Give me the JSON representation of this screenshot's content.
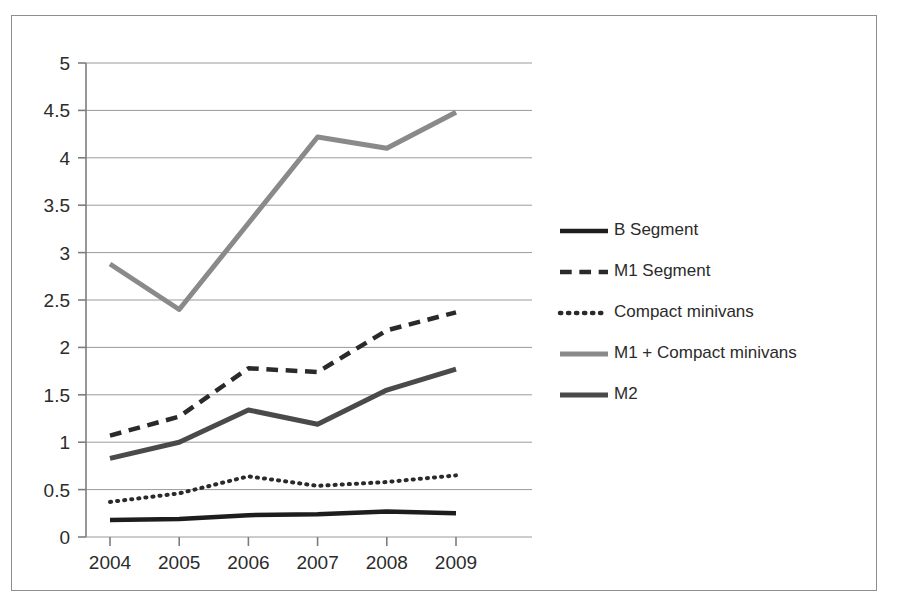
{
  "chart_data": {
    "type": "line",
    "title": "",
    "subtitle": "",
    "xlabel": "",
    "ylabel": "",
    "x": [
      "2004",
      "2005",
      "2006",
      "2007",
      "2008",
      "2009"
    ],
    "categories": [
      "2004",
      "2005",
      "2006",
      "2007",
      "2008",
      "2009"
    ],
    "xlim": [
      "2004",
      "2009"
    ],
    "ylim": [
      0,
      5
    ],
    "ytick_labels": [
      "0",
      "0.5",
      "1",
      "1.5",
      "2",
      "2.5",
      "3",
      "3.5",
      "4",
      "4.5",
      "5"
    ],
    "ytick_values": [
      0,
      0.5,
      1,
      1.5,
      2,
      2.5,
      3,
      3.5,
      4,
      4.5,
      5
    ],
    "grid": "horizontal",
    "legend_position": "right",
    "series": [
      {
        "name": "B Segment",
        "style": "solid",
        "color": "#1d1d1d",
        "width": 4.5,
        "values": [
          0.18,
          0.19,
          0.23,
          0.24,
          0.27,
          0.25
        ]
      },
      {
        "name": "M1 Segment",
        "style": "dashed",
        "color": "#2a2a2a",
        "width": 4.5,
        "values": [
          1.07,
          1.27,
          1.78,
          1.74,
          2.18,
          2.37
        ]
      },
      {
        "name": "Compact minivans",
        "style": "dotted",
        "color": "#2a2a2a",
        "width": 4.0,
        "values": [
          0.37,
          0.46,
          0.64,
          0.54,
          0.58,
          0.65
        ]
      },
      {
        "name": "M1 + Compact minivans",
        "style": "solid",
        "color": "#8a8a8a",
        "width": 5.0,
        "values": [
          2.88,
          2.4,
          3.31,
          4.22,
          4.1,
          4.48
        ]
      },
      {
        "name": "M2",
        "style": "solid",
        "color": "#4a4a4a",
        "width": 5.0,
        "values": [
          0.83,
          1.0,
          1.34,
          1.19,
          1.55,
          1.77
        ]
      }
    ]
  },
  "legend": {
    "items": [
      {
        "label": "B Segment"
      },
      {
        "label": "M1  Segment"
      },
      {
        "label": "Compact minivans"
      },
      {
        "label": "M1 + Compact minivans"
      },
      {
        "label": "M2"
      }
    ]
  },
  "axes": {
    "y_labels": [
      "5",
      "4.5",
      "4",
      "3.5",
      "3",
      "2.5",
      "2",
      "1.5",
      "1",
      "0.5",
      "0"
    ],
    "x_labels": [
      "2004",
      "2005",
      "2006",
      "2007",
      "2008",
      "2009"
    ]
  }
}
